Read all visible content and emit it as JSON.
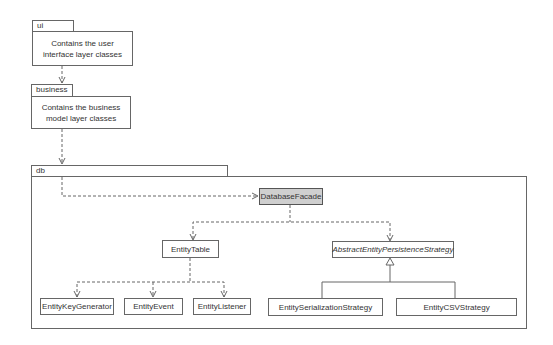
{
  "packages": {
    "ui": {
      "name": "ui",
      "description": "Contains the user interface layer classes"
    },
    "business": {
      "name": "business",
      "description": "Contains the business model layer classes"
    },
    "db": {
      "name": "db"
    }
  },
  "classes": {
    "database_facade": "DatabaseFacade",
    "entity_table": "EntityTable",
    "abstract_strategy": "AbstractEntityPersistenceStrategy",
    "entity_key_generator": "EntityKeyGenerator",
    "entity_event": "EntityEvent",
    "entity_listener": "EntityListener",
    "entity_serialization_strategy": "EntitySerializationStrategy",
    "entity_csv_strategy": "EntityCSVStrategy"
  },
  "relationships": [
    {
      "from": "ui",
      "to": "business",
      "type": "dependency"
    },
    {
      "from": "business",
      "to": "db",
      "type": "dependency"
    },
    {
      "from": "db",
      "to": "DatabaseFacade",
      "type": "dependency"
    },
    {
      "from": "DatabaseFacade",
      "to": "EntityTable",
      "type": "dependency"
    },
    {
      "from": "DatabaseFacade",
      "to": "AbstractEntityPersistenceStrategy",
      "type": "dependency"
    },
    {
      "from": "EntityTable",
      "to": "EntityKeyGenerator",
      "type": "dependency"
    },
    {
      "from": "EntityTable",
      "to": "EntityEvent",
      "type": "dependency"
    },
    {
      "from": "EntityTable",
      "to": "EntityListener",
      "type": "dependency"
    },
    {
      "from": "EntitySerializationStrategy",
      "to": "AbstractEntityPersistenceStrategy",
      "type": "generalization"
    },
    {
      "from": "EntityCSVStrategy",
      "to": "AbstractEntityPersistenceStrategy",
      "type": "generalization"
    }
  ],
  "colors": {
    "facade_fill": "#cfcfcf",
    "line": "#666666"
  }
}
